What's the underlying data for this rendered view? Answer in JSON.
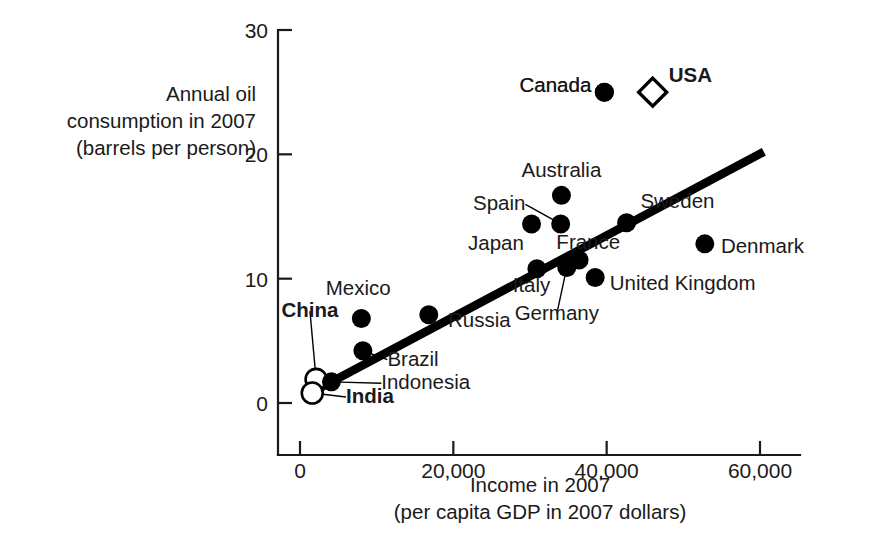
{
  "chart_data": {
    "type": "scatter",
    "title": "",
    "xlabel": "Income in 2007",
    "xlabel_sub": "(per capita GDP in 2007 dollars)",
    "ylabel_lines": [
      "Annual oil",
      "consumption in 2007",
      "(barrels per person)"
    ],
    "xlim": [
      0,
      65000
    ],
    "ylim": [
      0,
      30
    ],
    "xticks": [
      0,
      20000,
      40000,
      60000
    ],
    "xticklabels": [
      "0",
      "20,000",
      "40,000",
      "60,000"
    ],
    "yticks": [
      0,
      10,
      20,
      30
    ],
    "yticklabels": [
      "0",
      "10",
      "20",
      "30"
    ],
    "grid": false,
    "legend": "none",
    "marker_styles": {
      "filled_circle": "#000000",
      "open_circle": "#ffffff",
      "open_diamond": "#ffffff",
      "outline": "#000000"
    },
    "trend_line": {
      "label": "fitted regression line",
      "x_start": 2600,
      "y_start": 1.2,
      "x_end": 60500,
      "y_end": 20.2,
      "color": "#000000"
    },
    "points": [
      {
        "name": "China",
        "x": 2100,
        "y": 1.9,
        "marker": "open_circle",
        "bold": true,
        "label_x": 1300,
        "label_y": 6.9,
        "anchor": "middle",
        "leader": true
      },
      {
        "name": "India",
        "x": 1600,
        "y": 0.8,
        "marker": "open_circle",
        "bold": true,
        "label_x": 6000,
        "label_y": 0.0,
        "anchor": "start",
        "leader": true
      },
      {
        "name": "Indonesia",
        "x": 4100,
        "y": 1.7,
        "marker": "filled_circle",
        "bold": false,
        "label_x": 10600,
        "label_y": 1.1,
        "anchor": "start",
        "leader": true
      },
      {
        "name": "Brazil",
        "x": 8200,
        "y": 4.2,
        "marker": "filled_circle",
        "bold": false,
        "label_x": 11400,
        "label_y": 3.0,
        "anchor": "start",
        "leader": true
      },
      {
        "name": "Mexico",
        "x": 8000,
        "y": 6.8,
        "marker": "filled_circle",
        "bold": false,
        "label_x": 7600,
        "label_y": 8.7,
        "anchor": "middle",
        "leader": false
      },
      {
        "name": "Russia",
        "x": 16800,
        "y": 7.1,
        "marker": "filled_circle",
        "bold": false,
        "label_x": 19300,
        "label_y": 6.1,
        "anchor": "start",
        "leader": false
      },
      {
        "name": "Japan",
        "x": 30200,
        "y": 14.4,
        "marker": "filled_circle",
        "bold": false,
        "label_x": 29200,
        "label_y": 12.3,
        "anchor": "end",
        "leader": false
      },
      {
        "name": "Spain",
        "x": 34000,
        "y": 14.4,
        "marker": "filled_circle",
        "bold": false,
        "label_x": 29400,
        "label_y": 15.5,
        "anchor": "end",
        "leader": true
      },
      {
        "name": "Australia",
        "x": 34100,
        "y": 16.7,
        "marker": "filled_circle",
        "bold": false,
        "label_x": 34100,
        "label_y": 18.2,
        "anchor": "middle",
        "leader": false
      },
      {
        "name": "Italy",
        "x": 30900,
        "y": 10.8,
        "marker": "filled_circle",
        "bold": false,
        "label_x": 30200,
        "label_y": 8.9,
        "anchor": "middle",
        "leader": false
      },
      {
        "name": "Germany",
        "x": 34800,
        "y": 10.9,
        "marker": "filled_circle",
        "bold": false,
        "label_x": 33500,
        "label_y": 6.7,
        "anchor": "middle",
        "leader": true
      },
      {
        "name": "France",
        "x": 36400,
        "y": 11.5,
        "marker": "filled_circle",
        "bold": false,
        "label_x": 37600,
        "label_y": 12.4,
        "anchor": "middle",
        "leader": false
      },
      {
        "name": "United Kingdom",
        "x": 38500,
        "y": 10.1,
        "marker": "filled_circle",
        "bold": false,
        "label_x": 40400,
        "label_y": 9.1,
        "anchor": "start",
        "leader": false
      },
      {
        "name": "Sweden",
        "x": 42600,
        "y": 14.5,
        "marker": "filled_circle",
        "bold": false,
        "label_x": 44400,
        "label_y": 15.7,
        "anchor": "start",
        "leader": false
      },
      {
        "name": "Denmark",
        "x": 52800,
        "y": 12.8,
        "marker": "filled_circle",
        "bold": false,
        "label_x": 54900,
        "label_y": 12.1,
        "anchor": "start",
        "leader": false
      },
      {
        "name": "Canada",
        "x": 39700,
        "y": 25.0,
        "marker": "filled_circle",
        "bold": false,
        "label_x": 38000,
        "label_y": 25.0,
        "anchor": "end",
        "leader": false
      },
      {
        "name": "Canada",
        "x": 39700,
        "y": 25.0,
        "marker": "filled_circle",
        "bold": false,
        "label_x": 38000,
        "label_y": 25.0,
        "anchor": "end",
        "leader": false
      },
      {
        "name": "USA",
        "x": 46000,
        "y": 25.0,
        "marker": "open_diamond",
        "bold": true,
        "label_x": 48100,
        "label_y": 25.8,
        "anchor": "start",
        "leader": false
      }
    ]
  }
}
